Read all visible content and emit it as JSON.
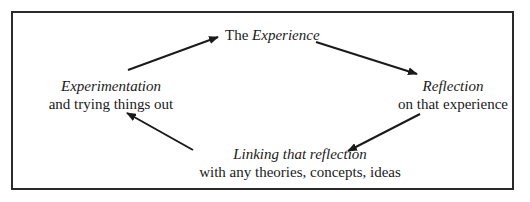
{
  "diagram": {
    "type": "cycle",
    "nodes": [
      {
        "id": "experience",
        "prefix": "The ",
        "emphasis": "Experience",
        "line2": ""
      },
      {
        "id": "reflection",
        "prefix": "",
        "emphasis": "Reflection",
        "line2": "on that experience"
      },
      {
        "id": "linking",
        "prefix": "",
        "emphasis": "Linking that reflection",
        "line2": "with any theories, concepts, ideas"
      },
      {
        "id": "experimentation",
        "prefix": "",
        "emphasis": "Experimentation",
        "line2": "and trying things out"
      }
    ],
    "edges": [
      {
        "from": "experimentation",
        "to": "experience"
      },
      {
        "from": "experience",
        "to": "reflection"
      },
      {
        "from": "reflection",
        "to": "linking"
      },
      {
        "from": "linking",
        "to": "experimentation"
      }
    ],
    "colors": {
      "line": "#1a1a1a",
      "frame": "#2a2a2a",
      "background": "#ffffff"
    }
  }
}
